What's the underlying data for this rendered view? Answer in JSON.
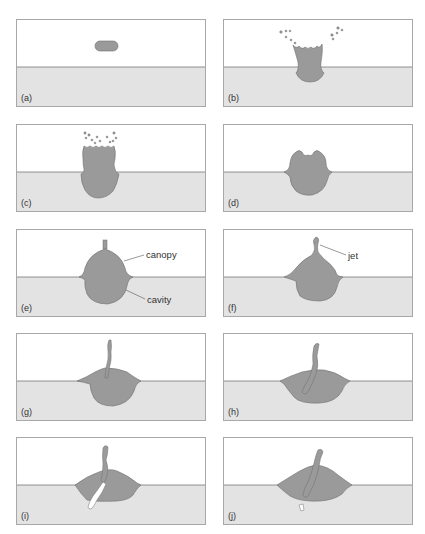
{
  "figure": {
    "colors": {
      "air": "#ffffff",
      "liquid": "#e3e3e3",
      "drop_fluid": "#9a9a9a",
      "outline": "#6e6e6e",
      "border": "#a8a8a8"
    },
    "panels": [
      {
        "label": "(a)"
      },
      {
        "label": "(b)"
      },
      {
        "label": "(c)"
      },
      {
        "label": "(d)"
      },
      {
        "label": "(e)",
        "annotations": [
          "canopy",
          "cavity"
        ]
      },
      {
        "label": "(f)",
        "annotations": [
          "jet"
        ]
      },
      {
        "label": "(g)"
      },
      {
        "label": "(h)"
      },
      {
        "label": "(i)"
      },
      {
        "label": "(j)"
      }
    ]
  }
}
